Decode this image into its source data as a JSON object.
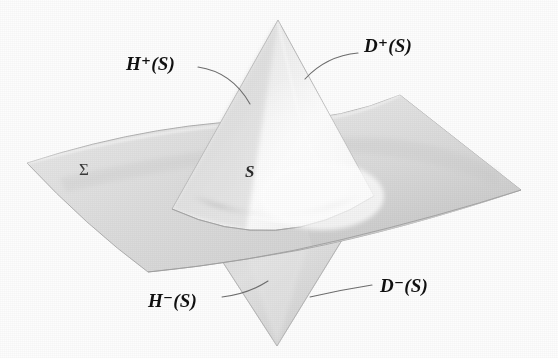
{
  "figure": {
    "background_color": "#fdfdfd",
    "style": "grayscale scanned textbook illustration"
  },
  "labels": {
    "h_plus": "H⁺(S)",
    "d_plus": "D⁺(S)",
    "h_minus": "H⁻(S)",
    "d_minus": "D⁻(S)",
    "sigma": "Σ",
    "s": "S"
  },
  "colors": {
    "plane_light": "#e3e3e3",
    "plane_mid": "#d2d2d2",
    "plane_dark": "#bdbdbd",
    "cone_upper_light": "#f8f8f8",
    "cone_upper_mid": "#e6e6e6",
    "cone_lower_mid": "#dcdcdc",
    "cone_lower_dark": "#c8c8c8",
    "outline": "#9a9a9a",
    "leader_line": "#6d6d6d",
    "label_text": "#101010",
    "sigma_text": "#3a3a3a"
  },
  "geometry": {
    "cone_upper_apex": [
      278,
      20
    ],
    "cone_lower_apex": [
      277,
      346
    ],
    "cone_waist_left": [
      172,
      208
    ],
    "cone_waist_right": [
      372,
      196
    ],
    "plane_corner_left": [
      27,
      163
    ],
    "plane_corner_top": [
      400,
      95
    ],
    "plane_corner_right": [
      521,
      190
    ],
    "plane_corner_bottom": [
      148,
      272
    ]
  },
  "leaders": [
    {
      "name": "h-plus-leader",
      "from": [
        198,
        67
      ],
      "to": [
        250,
        104
      ]
    },
    {
      "name": "d-plus-leader",
      "from": [
        358,
        53
      ],
      "to": [
        305,
        79
      ]
    },
    {
      "name": "h-minus-leader",
      "from": [
        222,
        297
      ],
      "to": [
        266,
        282
      ]
    },
    {
      "name": "d-minus-leader",
      "from": [
        372,
        285
      ],
      "to": [
        310,
        297
      ]
    }
  ]
}
